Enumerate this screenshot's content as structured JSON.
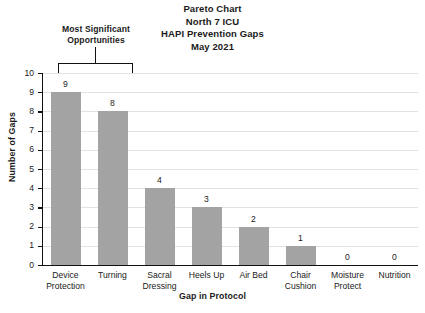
{
  "chart_data": {
    "type": "bar",
    "title": "Pareto Chart\nNorth 7 ICU\nHAPI Prevention Gaps\nMay 2021",
    "title_lines": [
      "Pareto Chart",
      "North 7 ICU",
      "HAPI Prevention Gaps",
      "May 2021"
    ],
    "categories": [
      "Device Protection",
      "Turning",
      "Sacral Dressing",
      "Heels Up",
      "Air Bed",
      "Chair Cushion",
      "Moisture Protect",
      "Nutrition"
    ],
    "category_lines": [
      [
        "Device",
        "Protection"
      ],
      [
        "Turning"
      ],
      [
        "Sacral",
        "Dressing"
      ],
      [
        "Heels Up"
      ],
      [
        "Air Bed"
      ],
      [
        "Chair",
        "Cushion"
      ],
      [
        "Moisture",
        "Protect"
      ],
      [
        "Nutrition"
      ]
    ],
    "values": [
      9,
      8,
      4,
      3,
      2,
      1,
      0,
      0
    ],
    "xlabel": "Gap in Protocol",
    "ylabel": "Number of Gaps",
    "ylim": [
      0,
      10
    ],
    "ytick_labels": [
      "10",
      "9",
      "8",
      "7",
      "6",
      "5",
      "4",
      "3",
      "2",
      "1",
      "0"
    ],
    "ytick_values": [
      10,
      9,
      8,
      7,
      6,
      5,
      4,
      3,
      2,
      1,
      0
    ],
    "grid": true,
    "legend": null,
    "bar_color": "#a3a3a3",
    "axis_color": "#111111",
    "grid_color": "#e3e3e3",
    "annotation": {
      "text_lines": [
        "Most Significant",
        "Opportunities"
      ],
      "covers_categories": [
        "Device Protection",
        "Turning"
      ]
    }
  }
}
